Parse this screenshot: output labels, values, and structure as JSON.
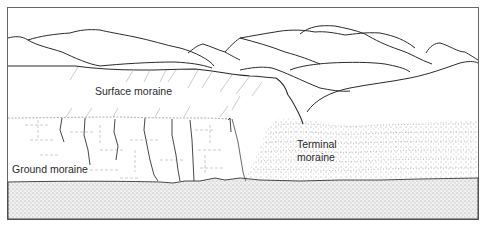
{
  "diagram": {
    "type": "geology-cross-section",
    "labels": {
      "surface_moraine": "Surface moraine",
      "ground_moraine": "Ground moraine",
      "terminal_moraine_line1": "Terminal",
      "terminal_moraine_line2": "moraine"
    },
    "colors": {
      "line": "#2b2b2b",
      "stipple": "#9a9a9a",
      "background": "#ffffff",
      "frame": "#555555"
    }
  }
}
